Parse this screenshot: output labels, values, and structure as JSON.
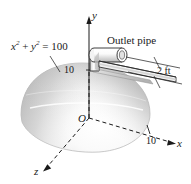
{
  "figure": {
    "kind": "3d-engineering-diagram",
    "background_color": "#ffffff",
    "ink_color": "#1a1a1a",
    "dome": {
      "name": "hemisphere-tank",
      "radius_label": "10",
      "fill_light": "#fdfdfd",
      "fill_mid": "#d9d9d9",
      "fill_dark": "#a8a8a8",
      "edge_color": "#9a9a9a"
    },
    "pipe": {
      "name": "outlet-pipe",
      "fill_light": "#ffffff",
      "fill_shade": "#cfcfcf",
      "outline": "#2a2a2a"
    },
    "labels": {
      "equation": {
        "base_x": "x",
        "exp_x": "2",
        "plus": " + ",
        "base_y": "y",
        "exp_y": "2",
        "equals": " = ",
        "value": "100",
        "full": "x2 + y2 = 100"
      },
      "outlet_pipe": "Outlet pipe",
      "pipe_length": "2 ft",
      "axis_y": "y",
      "axis_x": "x",
      "axis_z": "z",
      "origin": "O",
      "tick_y": "10",
      "tick_x": "10"
    }
  }
}
